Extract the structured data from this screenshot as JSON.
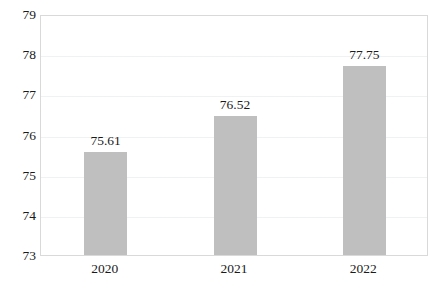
{
  "chart_data": {
    "type": "bar",
    "title": "",
    "subtitle": "",
    "xlabel": "",
    "ylabel": "",
    "categories": [
      "2020",
      "2021",
      "2022"
    ],
    "values": [
      75.61,
      76.52,
      77.75
    ],
    "data_labels": [
      "75.61",
      "76.52",
      "77.75"
    ],
    "ylim": [
      73,
      79
    ],
    "ytick_labels": [
      "73",
      "74",
      "75",
      "76",
      "77",
      "78",
      "79"
    ],
    "ytick_values": [
      73,
      74,
      75,
      76,
      77,
      78,
      79
    ],
    "grid": true,
    "legend": false,
    "legend_position": "none",
    "bar_color": "#bfbfbf",
    "gridline_color": "#eff1f3",
    "frame_color": "#d9d9d9",
    "text_color": "#1a1a1a",
    "background_color": "#ffffff"
  }
}
